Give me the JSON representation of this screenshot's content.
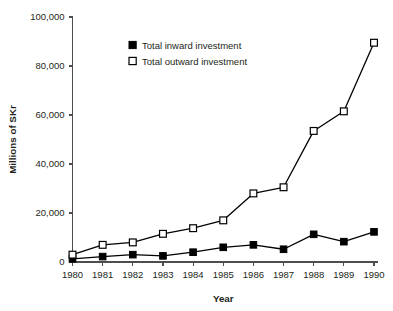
{
  "chart_data": {
    "type": "line",
    "title": "",
    "xlabel": "Year",
    "ylabel": "Millions of SKr",
    "x": [
      1980,
      1981,
      1982,
      1983,
      1984,
      1985,
      1986,
      1987,
      1988,
      1989,
      1990
    ],
    "xtick_labels": [
      "1980",
      "1981",
      "1982",
      "1983",
      "1984",
      "1985",
      "1986",
      "1987",
      "1988",
      "1989",
      "1990"
    ],
    "ytick_labels": [
      "0",
      "20,000",
      "40,000",
      "60,000",
      "80,000",
      "100,000"
    ],
    "ytick_values": [
      0,
      20000,
      40000,
      60000,
      80000,
      100000
    ],
    "ylim": [
      0,
      100000
    ],
    "xlim": [
      1980,
      1990
    ],
    "grid": false,
    "legend_position": "upper-left-inside",
    "series": [
      {
        "name": "Total inward investment",
        "marker": "filled-square",
        "color": "#000000",
        "values": [
          1300,
          2200,
          3000,
          2500,
          4000,
          6000,
          7000,
          5200,
          11300,
          8300,
          12300
        ]
      },
      {
        "name": "Total outward investment",
        "marker": "open-square",
        "color": "#000000",
        "values": [
          3000,
          7000,
          8000,
          11500,
          13800,
          17000,
          28000,
          30500,
          53500,
          61500,
          89500
        ]
      }
    ]
  },
  "legend": {
    "items": [
      {
        "label": "Total inward investment",
        "marker": "filled-square"
      },
      {
        "label": "Total outward investment",
        "marker": "open-square"
      }
    ]
  }
}
